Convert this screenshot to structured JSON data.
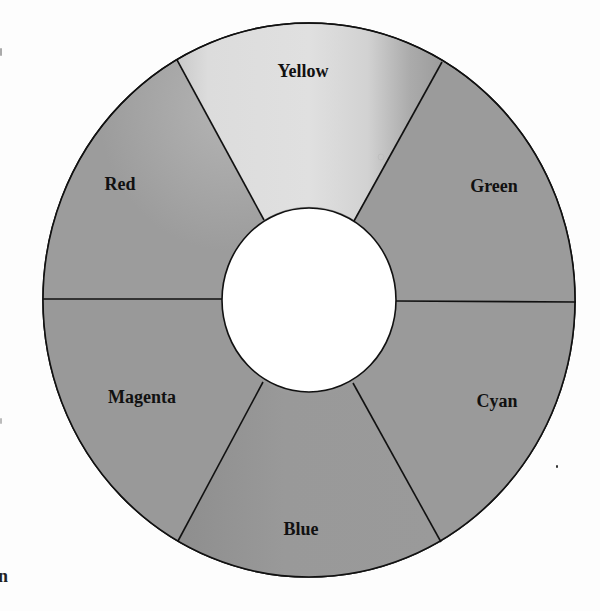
{
  "diagram": {
    "type": "color-wheel",
    "center": {
      "x": 309,
      "y": 300
    },
    "outer_radius": {
      "x": 266,
      "y": 277
    },
    "inner_radius": {
      "x": 87,
      "y": 92
    },
    "segments": [
      {
        "id": "yellow",
        "label": "Yellow",
        "label_x": 303,
        "label_y": 77,
        "fill": "#d6d6d6"
      },
      {
        "id": "green",
        "label": "Green",
        "label_x": 494,
        "label_y": 192,
        "fill": "#9b9b9b"
      },
      {
        "id": "cyan",
        "label": "Cyan",
        "label_x": 497,
        "label_y": 407,
        "fill": "#9a9a9a"
      },
      {
        "id": "blue",
        "label": "Blue",
        "label_x": 301,
        "label_y": 535,
        "fill": "#989898"
      },
      {
        "id": "magenta",
        "label": "Magenta",
        "label_x": 142,
        "label_y": 403,
        "fill": "#999999"
      },
      {
        "id": "red",
        "label": "Red",
        "label_x": 120,
        "label_y": 190,
        "fill": "#9c9c9c"
      }
    ],
    "colors": {
      "ring_gray": "#9a9a9a",
      "yellow_light": "#dedede",
      "yellow_dark": "#a4a4a4",
      "hole": "#ffffff",
      "stroke": "#111111",
      "label": "#111111"
    }
  },
  "artifacts": {
    "left_edge_glyph": "n"
  }
}
